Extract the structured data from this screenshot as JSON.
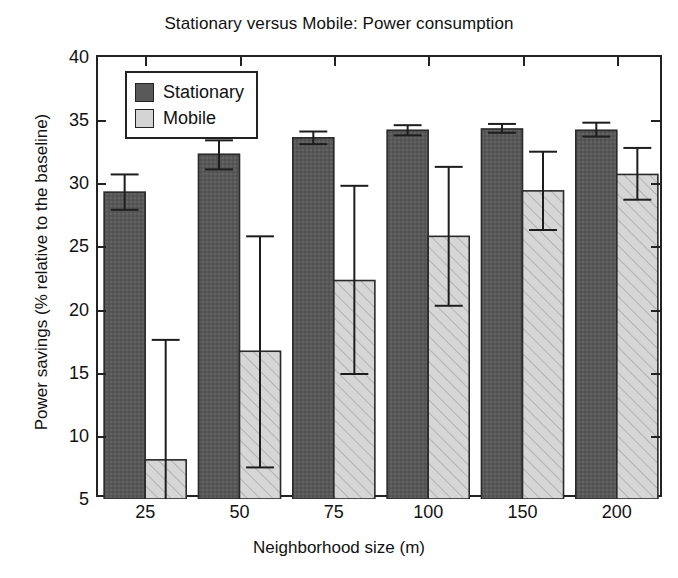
{
  "chart_data": {
    "type": "bar",
    "title": "Stationary versus Mobile: Power consumption",
    "xlabel": "Neighborhood size (m)",
    "ylabel": "Power savings (% relative to the baseline)",
    "categories": [
      "25",
      "50",
      "75",
      "100",
      "150",
      "200"
    ],
    "ylim": [
      5,
      40
    ],
    "yticks": [
      5,
      10,
      15,
      20,
      25,
      30,
      35,
      40
    ],
    "grid": false,
    "legend_position": "upper left",
    "series": [
      {
        "name": "Stationary",
        "color": "#595959",
        "pattern": "solid-dark",
        "values": [
          29.3,
          32.3,
          33.6,
          34.2,
          34.3,
          34.2
        ],
        "err_low": [
          27.9,
          31.1,
          33.1,
          33.8,
          34.0,
          33.7
        ],
        "err_high": [
          30.7,
          33.4,
          34.1,
          34.6,
          34.7,
          34.8
        ]
      },
      {
        "name": "Mobile",
        "color": "#d4d4d4",
        "pattern": "diagonal-hatch",
        "values": [
          8.1,
          16.7,
          22.3,
          25.8,
          29.4,
          30.7
        ],
        "err_low": [
          5.0,
          7.5,
          14.9,
          20.3,
          26.3,
          28.7
        ],
        "err_high": [
          17.6,
          25.8,
          29.8,
          31.3,
          32.5,
          32.8
        ]
      }
    ]
  },
  "legend": {
    "items": [
      {
        "label": "Stationary"
      },
      {
        "label": "Mobile"
      }
    ]
  }
}
